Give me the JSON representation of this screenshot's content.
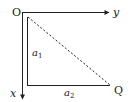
{
  "diagram": {
    "origin_label": "O",
    "x_axis_label": "x",
    "y_axis_label": "y",
    "point_label": "Q",
    "side_a1": {
      "base": "a",
      "sub": "1"
    },
    "side_a2": {
      "base": "a",
      "sub": "2"
    },
    "colors": {
      "stroke": "#222222",
      "background": "#ffffff"
    }
  }
}
